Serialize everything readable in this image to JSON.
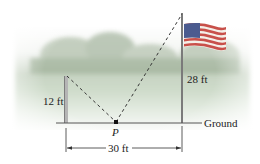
{
  "figure": {
    "left_pole": {
      "height_label": "12 ft"
    },
    "flagpole": {
      "height_label": "28 ft"
    },
    "point": {
      "label": "P"
    },
    "ground": {
      "label": "Ground"
    },
    "distance": {
      "label": "30 ft"
    }
  },
  "colors": {
    "pole": "#9a9a9a",
    "ground_line": "#555555",
    "dashed": "#333333",
    "sky": "#ffffff",
    "grass": "#dfe8dc",
    "trees": "#a9b9a2",
    "flag_red": "#c8504a",
    "flag_blue": "#4b5b8f"
  }
}
